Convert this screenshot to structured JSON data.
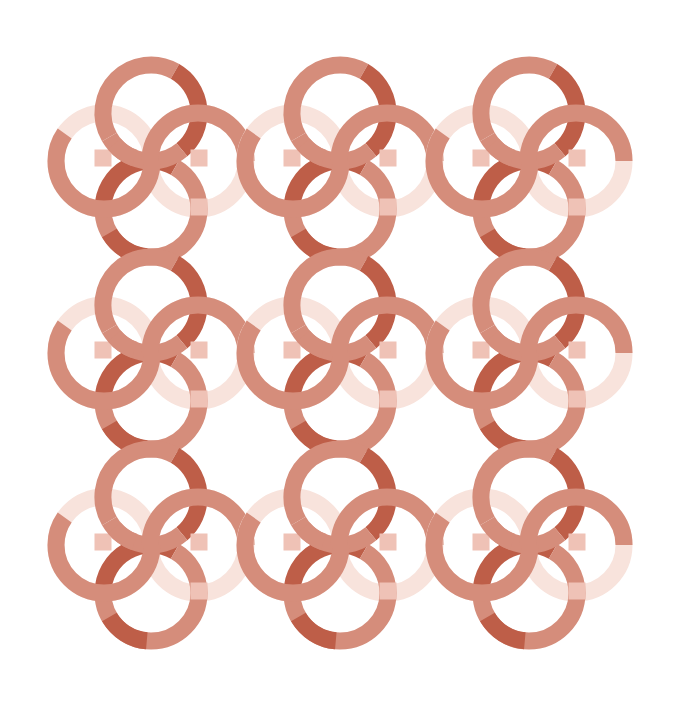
{
  "artwork": {
    "title": "Interlocking rings pattern",
    "description": "3x3 repeating tile of interlocking terracotta rings linked by a horizontal S-wave band with pale ghost rings",
    "grid": {
      "columns": 3,
      "rows": 3,
      "origin_x": 151,
      "origin_y": 113,
      "step_x": 189,
      "step_y": 192
    },
    "ring": {
      "radius": 48,
      "stroke_width": 17
    },
    "colors": {
      "background": "#ffffff",
      "dark": "#BE5E48",
      "medium": "#D58D7B",
      "pale": "#F8E3DC",
      "overlap": "#EFC2B6"
    }
  }
}
